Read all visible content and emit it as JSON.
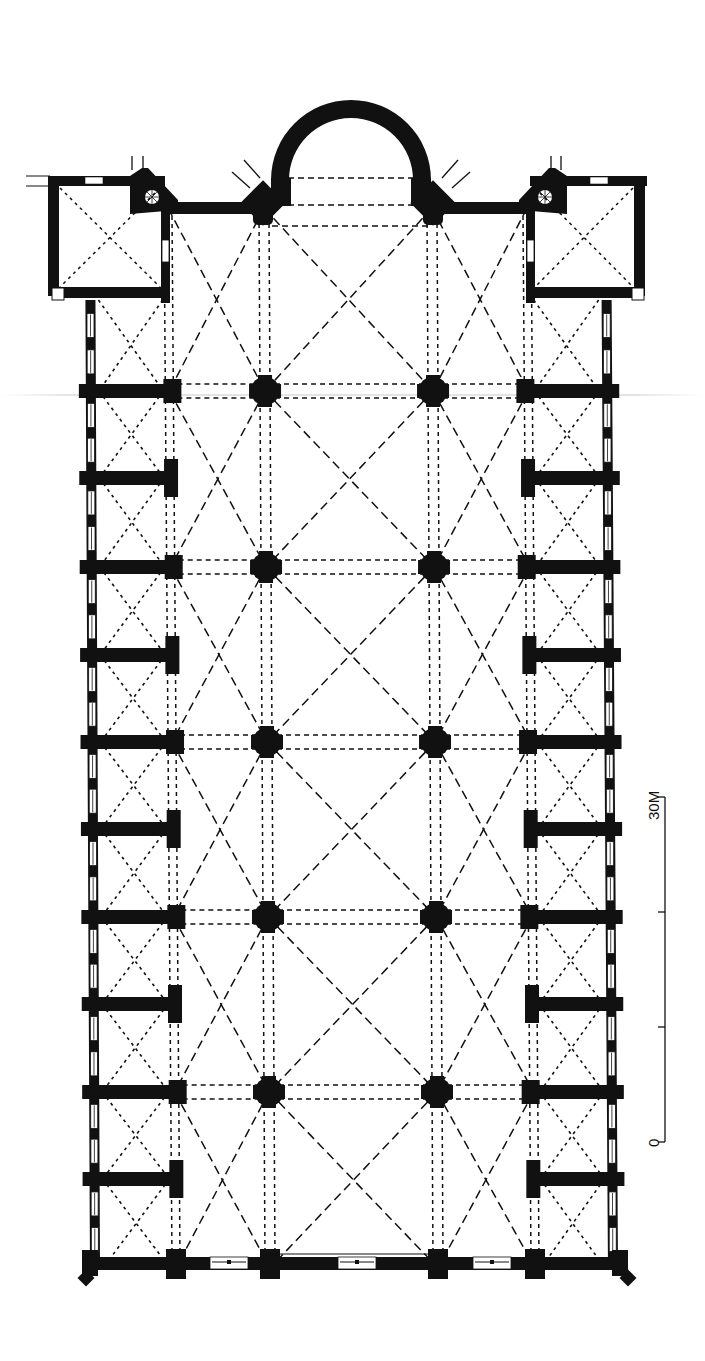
{
  "figure": {
    "type": "architectural floor plan",
    "colors": {
      "ink": "#111111",
      "paper": "#ffffff",
      "artifact": "#cfcfcf"
    }
  },
  "scale_bar": {
    "start_label": "0",
    "end_label": "30M",
    "ticks": [
      0,
      10,
      20,
      30
    ],
    "unit": "M"
  },
  "geometry": {
    "outer_left": [
      90,
      95
    ],
    "outer_right": [
      606,
      613
    ],
    "aisle_left": [
      168,
      176
    ],
    "aisle_right": [
      527,
      535
    ],
    "nave_left": [
      264,
      270
    ],
    "nave_right": [
      432,
      438
    ],
    "major_rows": [
      391,
      567,
      742,
      917,
      1092
    ],
    "minor_rows": [
      300,
      478,
      655,
      829,
      1004,
      1179
    ],
    "top_wall_y": 208,
    "bottom_wall_y": 1268,
    "apse": {
      "cx": 351,
      "top": 100,
      "r_outer": 80,
      "r_inner": 62,
      "base_y": 178
    }
  }
}
